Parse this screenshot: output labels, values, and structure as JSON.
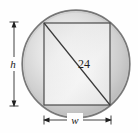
{
  "figure": {
    "type": "geometry-diagram",
    "background_color": "#fefefe",
    "shapes": {
      "circle": {
        "name": "circle",
        "center_x": 76,
        "center_y": 64,
        "radius": 54,
        "fill_light": "#f2f2f2",
        "fill_dark": "#b3b3b3",
        "stroke": "#7a7a7a"
      },
      "rectangle": {
        "name": "inscribed-rectangle",
        "x": 44,
        "y": 23,
        "width": 66,
        "height": 82,
        "fill_light": "#fbfbfb",
        "fill_dark": "#c9c9c9",
        "stroke": "#4d4d4d"
      },
      "diagonal": {
        "name": "rectangle-diagonal",
        "x1": 44,
        "y1": 23,
        "x2": 110,
        "y2": 105,
        "stroke": "#3a3a3a"
      }
    },
    "labels": {
      "diagonal_value": "24",
      "height_label": "h",
      "width_label": "w"
    },
    "dimensions": {
      "height_arrow": {
        "name": "height-dimension-arrow",
        "x": 14,
        "y_top": 22,
        "y_bottom": 106,
        "stroke": "#2e2e2e"
      },
      "width_arrow": {
        "name": "width-dimension-arrow",
        "y": 120,
        "x_left": 44,
        "x_right": 111,
        "stroke": "#2e2e2e"
      }
    }
  }
}
